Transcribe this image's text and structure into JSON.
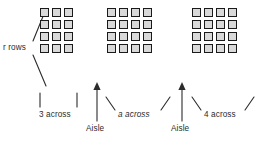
{
  "diagram": {
    "background_color": "#ffffff",
    "seat_fill_color": "#d9d9d9",
    "seat_border_color": "#1a1a1a",
    "line_color": "#2b2b2b",
    "rows_count": 4,
    "labels": {
      "rows": "r rows",
      "section1_across": "3 across",
      "section2_across": "a across",
      "section3_across": "4 across",
      "aisle_left": "Aisle",
      "aisle_right": "Aisle"
    },
    "sections": [
      {
        "name": "section-left",
        "columns": 3,
        "rows": 4,
        "across_label": "3 across"
      },
      {
        "name": "section-middle",
        "columns": 4,
        "rows": 4,
        "across_label": "a across"
      },
      {
        "name": "section-right",
        "columns": 4,
        "rows": 4,
        "across_label": "4 across"
      }
    ],
    "aisles": [
      {
        "name": "aisle-1",
        "label": "Aisle"
      },
      {
        "name": "aisle-2",
        "label": "Aisle"
      }
    ]
  }
}
